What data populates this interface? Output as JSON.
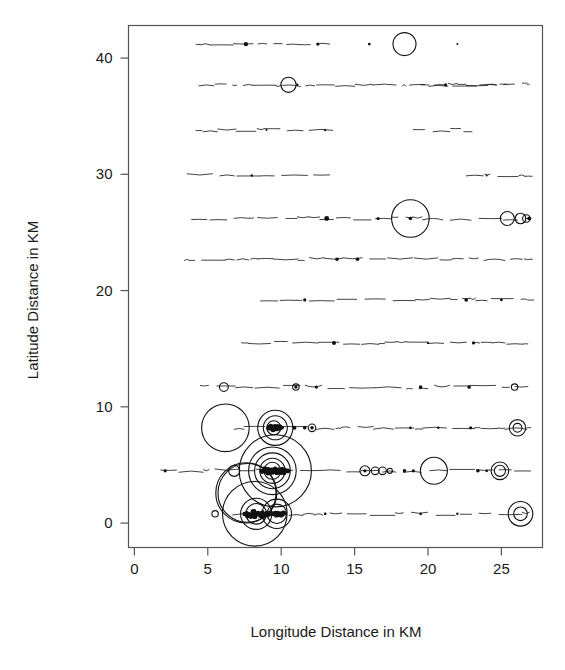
{
  "chart_data": {
    "type": "scatter",
    "title": "",
    "subtitle": "",
    "xlabel": "Longitude Distance in KM",
    "ylabel": "Latitude Distance in KM",
    "xlim": [
      -0.4,
      27.8
    ],
    "ylim": [
      -2.1,
      42.8
    ],
    "xticks": [
      0,
      5,
      10,
      15,
      20,
      25
    ],
    "xticklabels": [
      "0",
      "5",
      "10",
      "15",
      "20",
      "25"
    ],
    "yticks": [
      0,
      10,
      20,
      30,
      40
    ],
    "yticklabels": [
      "0",
      "10",
      "20",
      "30",
      "40"
    ],
    "grid": false,
    "legend": null,
    "marker": "open-circle",
    "size_encoding": "bubble-radius-proportional-to-value",
    "transect_latitudes": [
      41.2,
      37.7,
      33.8,
      29.9,
      26.2,
      22.7,
      19.2,
      15.5,
      11.7,
      8.2,
      4.5,
      0.8
    ],
    "series": [
      {
        "name": "bubbles",
        "points": [
          {
            "x": 18.4,
            "y": 41.2,
            "r": 0.78
          },
          {
            "x": 10.5,
            "y": 37.7,
            "r": 0.52
          },
          {
            "x": 18.8,
            "y": 26.2,
            "r": 1.28
          },
          {
            "x": 25.4,
            "y": 26.2,
            "r": 0.48
          },
          {
            "x": 26.3,
            "y": 26.2,
            "r": 0.36
          },
          {
            "x": 26.7,
            "y": 26.2,
            "r": 0.26
          },
          {
            "x": 6.1,
            "y": 11.7,
            "r": 0.3
          },
          {
            "x": 11.0,
            "y": 11.7,
            "r": 0.22
          },
          {
            "x": 25.9,
            "y": 11.7,
            "r": 0.22
          },
          {
            "x": 6.2,
            "y": 8.2,
            "r": 1.62
          },
          {
            "x": 9.6,
            "y": 8.2,
            "r": 1.2
          },
          {
            "x": 9.6,
            "y": 8.2,
            "r": 0.82
          },
          {
            "x": 9.5,
            "y": 8.2,
            "r": 0.48
          },
          {
            "x": 12.1,
            "y": 8.2,
            "r": 0.26
          },
          {
            "x": 26.1,
            "y": 8.2,
            "r": 0.56
          },
          {
            "x": 26.1,
            "y": 8.2,
            "r": 0.3
          },
          {
            "x": 9.6,
            "y": 4.5,
            "r": 2.46
          },
          {
            "x": 9.4,
            "y": 4.5,
            "r": 1.62
          },
          {
            "x": 9.4,
            "y": 4.5,
            "r": 1.22
          },
          {
            "x": 9.4,
            "y": 4.5,
            "r": 0.86
          },
          {
            "x": 9.4,
            "y": 4.5,
            "r": 0.58
          },
          {
            "x": 6.8,
            "y": 4.5,
            "r": 0.38
          },
          {
            "x": 15.7,
            "y": 4.5,
            "r": 0.34
          },
          {
            "x": 16.4,
            "y": 4.5,
            "r": 0.26
          },
          {
            "x": 16.9,
            "y": 4.5,
            "r": 0.26
          },
          {
            "x": 17.4,
            "y": 4.5,
            "r": 0.18
          },
          {
            "x": 20.4,
            "y": 4.5,
            "r": 0.92
          },
          {
            "x": 24.9,
            "y": 4.5,
            "r": 0.6
          },
          {
            "x": 24.9,
            "y": 4.5,
            "r": 0.38
          },
          {
            "x": 8.2,
            "y": 0.8,
            "r": 2.2
          },
          {
            "x": 8.3,
            "y": 0.8,
            "r": 1.06
          },
          {
            "x": 8.3,
            "y": 0.8,
            "r": 0.7
          },
          {
            "x": 9.7,
            "y": 0.8,
            "r": 1.0
          },
          {
            "x": 9.7,
            "y": 0.8,
            "r": 0.66
          },
          {
            "x": 5.5,
            "y": 0.8,
            "r": 0.22
          },
          {
            "x": 26.3,
            "y": 0.8,
            "r": 0.84
          },
          {
            "x": 26.3,
            "y": 0.8,
            "r": 0.46
          },
          {
            "x": 7.6,
            "y": 2.6,
            "r": 2.05
          },
          {
            "x": 7.7,
            "y": 2.6,
            "r": 2.0
          }
        ]
      },
      {
        "name": "dots",
        "points": [
          {
            "x": 7.6,
            "y": 41.2,
            "s": 2.2
          },
          {
            "x": 12.5,
            "y": 41.2,
            "s": 1.6
          },
          {
            "x": 16.0,
            "y": 41.2,
            "s": 1.4
          },
          {
            "x": 22.0,
            "y": 41.2,
            "s": 1.0
          },
          {
            "x": 11.1,
            "y": 37.7,
            "s": 1.2
          },
          {
            "x": 21.2,
            "y": 37.7,
            "s": 1.6
          },
          {
            "x": 13.0,
            "y": 33.8,
            "s": 1.2
          },
          {
            "x": 9.0,
            "y": 33.8,
            "s": 1.0
          },
          {
            "x": 8.0,
            "y": 29.9,
            "s": 1.2
          },
          {
            "x": 24.0,
            "y": 29.9,
            "s": 1.0
          },
          {
            "x": 13.1,
            "y": 26.2,
            "s": 2.4
          },
          {
            "x": 16.6,
            "y": 26.2,
            "s": 1.6
          },
          {
            "x": 18.8,
            "y": 26.2,
            "s": 1.8
          },
          {
            "x": 26.9,
            "y": 26.2,
            "s": 2.0
          },
          {
            "x": 13.8,
            "y": 22.7,
            "s": 1.8
          },
          {
            "x": 15.2,
            "y": 22.7,
            "s": 1.8
          },
          {
            "x": 11.6,
            "y": 19.2,
            "s": 1.6
          },
          {
            "x": 22.6,
            "y": 19.2,
            "s": 1.8
          },
          {
            "x": 25.0,
            "y": 19.2,
            "s": 1.4
          },
          {
            "x": 13.6,
            "y": 15.5,
            "s": 2.0
          },
          {
            "x": 20.0,
            "y": 15.5,
            "s": 1.2
          },
          {
            "x": 23.1,
            "y": 15.5,
            "s": 1.6
          },
          {
            "x": 11.0,
            "y": 11.7,
            "s": 1.6
          },
          {
            "x": 12.4,
            "y": 11.7,
            "s": 1.6
          },
          {
            "x": 19.5,
            "y": 11.7,
            "s": 1.8
          },
          {
            "x": 22.8,
            "y": 11.7,
            "s": 1.8
          },
          {
            "x": 10.9,
            "y": 8.2,
            "s": 2.0
          },
          {
            "x": 11.6,
            "y": 8.2,
            "s": 1.8
          },
          {
            "x": 12.1,
            "y": 8.2,
            "s": 1.8
          },
          {
            "x": 18.8,
            "y": 8.2,
            "s": 1.4
          },
          {
            "x": 20.7,
            "y": 8.2,
            "s": 1.2
          },
          {
            "x": 22.9,
            "y": 8.2,
            "s": 1.6
          },
          {
            "x": 2.1,
            "y": 4.5,
            "s": 1.6
          },
          {
            "x": 15.7,
            "y": 4.5,
            "s": 1.6
          },
          {
            "x": 18.4,
            "y": 4.5,
            "s": 1.8
          },
          {
            "x": 19.0,
            "y": 4.5,
            "s": 1.6
          },
          {
            "x": 23.4,
            "y": 4.5,
            "s": 1.8
          },
          {
            "x": 24.0,
            "y": 4.5,
            "s": 1.4
          },
          {
            "x": 13.0,
            "y": 0.8,
            "s": 1.4
          },
          {
            "x": 19.5,
            "y": 0.8,
            "s": 1.4
          },
          {
            "x": 22.0,
            "y": 0.8,
            "s": 1.2
          }
        ]
      }
    ]
  },
  "axes": {
    "x_title": "Longitude Distance in KM",
    "y_title": "Latitude Distance in KM",
    "x_tick_labels": [
      "0",
      "5",
      "10",
      "15",
      "20",
      "25"
    ],
    "y_tick_labels": [
      "0",
      "10",
      "20",
      "30",
      "40"
    ]
  },
  "colors": {
    "background": "#ffffff",
    "ink": "#111111",
    "axis": "#555555"
  }
}
